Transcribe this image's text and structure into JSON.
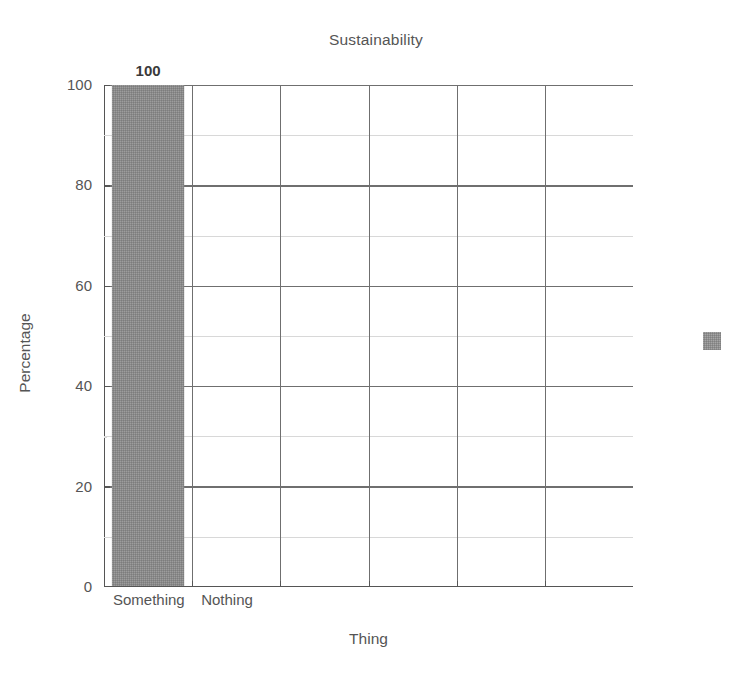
{
  "chart_data": {
    "type": "bar",
    "title": "Sustainability",
    "xlabel": "Thing",
    "ylabel": "Percentage",
    "categories": [
      "Something",
      "Nothing",
      "",
      "",
      "",
      ""
    ],
    "values": [
      100,
      null,
      null,
      null,
      null,
      null
    ],
    "data_labels": [
      "100"
    ],
    "ylim": [
      0,
      100
    ],
    "y_ticks": [
      "0",
      "20",
      "40",
      "60",
      "80",
      "100"
    ],
    "y_tick_values": [
      0,
      20,
      40,
      60,
      80,
      100
    ],
    "y_minor_tick_values": [
      10,
      30,
      50,
      70,
      90
    ],
    "grid": "major and minor horizontal, major vertical",
    "legend": {
      "position": "right",
      "entries": [
        {
          "label": "",
          "color": "#8a8a8a"
        }
      ]
    },
    "series": [
      {
        "name": "",
        "color": "#8a8a8a",
        "values": [
          100,
          null,
          null,
          null,
          null,
          null
        ]
      }
    ],
    "colors": {
      "bar": "#8a8a8a",
      "axis": "#555555",
      "major_grid": "#6f6f6f",
      "minor_grid": "#d8d8d8",
      "text": "#555555"
    }
  }
}
